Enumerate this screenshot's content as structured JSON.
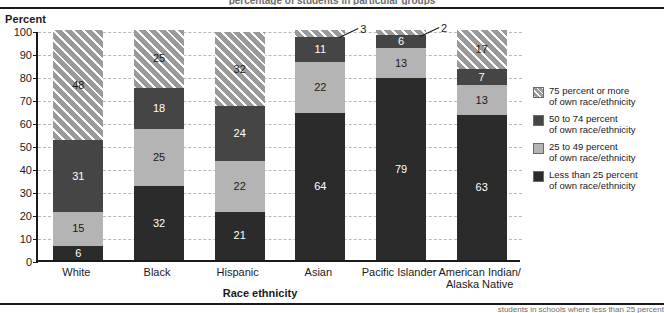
{
  "figure": {
    "top_cropped_text": "percentage of students in particular groups",
    "bottom_cropped_text": "students in schools where less than 25 percent"
  },
  "axes": {
    "y_title": "Percent",
    "x_title": "Race ethnicity",
    "y_ticks": [
      "100",
      "90",
      "80",
      "70",
      "60",
      "50",
      "40",
      "30",
      "20",
      "10",
      "0"
    ]
  },
  "legend": {
    "items": [
      {
        "name": "legend-75-or-more",
        "label": "75 percent or more\nof own race/ethnicity",
        "line1": "75 percent or more",
        "line2": "of own race/ethnicity",
        "color": "#9a9a9a",
        "pattern": "diagonal-hatch"
      },
      {
        "name": "legend-50-to-74",
        "label": "50 to 74 percent\nof own race/ethnicity",
        "line1": "50 to 74 percent",
        "line2": "of own race/ethnicity",
        "color": "#454545",
        "pattern": "solid"
      },
      {
        "name": "legend-25-to-49",
        "label": "25 to 49 percent\nof own race/ethnicity",
        "line1": "25 to 49 percent",
        "line2": "of own race/ethnicity",
        "color": "#b4b4b4",
        "pattern": "solid"
      },
      {
        "name": "legend-less-than-25",
        "label": "Less than 25 percent\nof own race/ethnicity",
        "line1": "Less than 25 percent",
        "line2": "of own race/ethnicity",
        "color": "#2b2b2b",
        "pattern": "solid"
      }
    ]
  },
  "chart_data": {
    "type": "bar",
    "subtype": "stacked-vertical-100pct",
    "title": "",
    "xlabel": "Race ethnicity",
    "ylabel": "Percent",
    "ylim": [
      0,
      100
    ],
    "ytick_step": 10,
    "grid": true,
    "legend_position": "right",
    "categories": [
      "White",
      "Black",
      "Hispanic",
      "Asian",
      "Pacific Islander",
      "American Indian/ Alaska Native"
    ],
    "category_lines": [
      [
        "White"
      ],
      [
        "Black"
      ],
      [
        "Hispanic"
      ],
      [
        "Asian"
      ],
      [
        "Pacific Islander"
      ],
      [
        "American Indian/",
        "Alaska Native"
      ]
    ],
    "series": [
      {
        "name": "Less than 25 percent of own race/ethnicity",
        "color": "#2b2b2b",
        "values": [
          6,
          32,
          21,
          64,
          79,
          63
        ]
      },
      {
        "name": "25 to 49 percent of own race/ethnicity",
        "color": "#b4b4b4",
        "values": [
          15,
          25,
          22,
          22,
          13,
          13
        ]
      },
      {
        "name": "50 to 74 percent of own race/ethnicity",
        "color": "#454545",
        "values": [
          31,
          18,
          24,
          11,
          6,
          7
        ]
      },
      {
        "name": "75 percent or more of own race/ethnicity",
        "color": "#9a9a9a",
        "values": [
          48,
          25,
          32,
          3,
          2,
          17
        ]
      }
    ],
    "callouts": [
      {
        "category": "Asian",
        "series": "75 percent or more of own race/ethnicity",
        "value": "3"
      },
      {
        "category": "Pacific Islander",
        "series": "75 percent or more of own race/ethnicity",
        "value": "2"
      }
    ]
  }
}
